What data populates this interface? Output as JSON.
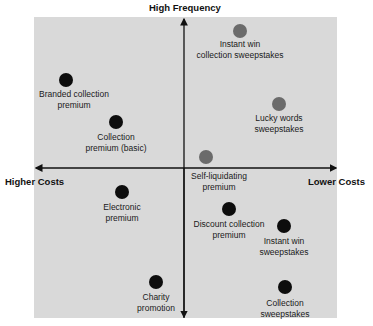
{
  "axes": {
    "top": "High Frequency",
    "left": "Higher Costs",
    "right": "Lower Costs"
  },
  "colors": {
    "background": "#d9d9d9",
    "dot_black": "#0d0d0d",
    "dot_gray": "#6b6b6b",
    "axis": "#111111"
  },
  "items": [
    {
      "label_line1": "Instant win",
      "label_line2": "collection sweepstakes",
      "color": "gray"
    },
    {
      "label_line1": "Branded collection",
      "label_line2": "premium",
      "color": "black"
    },
    {
      "label_line1": "Lucky words",
      "label_line2": "sweepstakes",
      "color": "gray"
    },
    {
      "label_line1": "Collection",
      "label_line2": "premium (basic)",
      "color": "black"
    },
    {
      "label_line1": "Self-liquidating",
      "label_line2": "premium",
      "color": "gray"
    },
    {
      "label_line1": "Electronic",
      "label_line2": "premium",
      "color": "black"
    },
    {
      "label_line1": "Discount collection",
      "label_line2": "premium",
      "color": "black"
    },
    {
      "label_line1": "Instant win",
      "label_line2": "sweepstakes",
      "color": "black"
    },
    {
      "label_line1": "Charity",
      "label_line2": "promotion",
      "color": "black"
    },
    {
      "label_line1": "Collection",
      "label_line2": "sweepstakes",
      "color": "black"
    }
  ]
}
